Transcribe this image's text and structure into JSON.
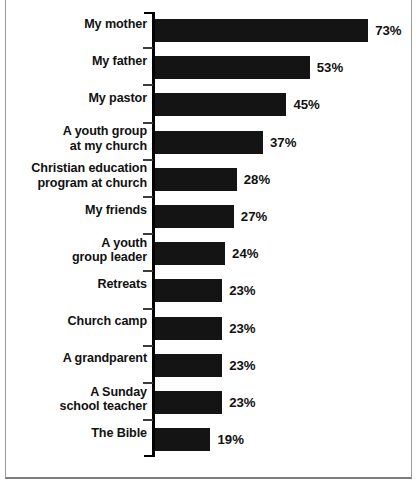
{
  "chart_data": {
    "type": "bar",
    "orientation": "horizontal",
    "title": "",
    "subtitle": "",
    "xlabel": "",
    "ylabel": "",
    "xlim": [
      0,
      80
    ],
    "grid": false,
    "legend": null,
    "value_suffix": "%",
    "categories": [
      "My mother",
      "My father",
      "My pastor",
      "A youth group at my church",
      "Christian education program at church",
      "My friends",
      "A youth group leader",
      "Retreats",
      "Church camp",
      "A grandparent",
      "A Sunday school teacher",
      "The Bible"
    ],
    "values": [
      73,
      53,
      45,
      37,
      28,
      27,
      24,
      23,
      23,
      23,
      23,
      19
    ],
    "data_labels": [
      "73%",
      "53%",
      "45%",
      "37%",
      "28%",
      "27%",
      "24%",
      "23%",
      "23%",
      "23%",
      "23%",
      "19%"
    ],
    "bars": [
      {
        "label_line1": "My mother",
        "label_line2": "",
        "value": 73,
        "data_label": "73%"
      },
      {
        "label_line1": "My father",
        "label_line2": "",
        "value": 53,
        "data_label": "53%"
      },
      {
        "label_line1": "My pastor",
        "label_line2": "",
        "value": 45,
        "data_label": "45%"
      },
      {
        "label_line1": "A youth group",
        "label_line2": "at my church",
        "value": 37,
        "data_label": "37%"
      },
      {
        "label_line1": "Christian education",
        "label_line2": "program at church",
        "value": 28,
        "data_label": "28%"
      },
      {
        "label_line1": "My friends",
        "label_line2": "",
        "value": 27,
        "data_label": "27%"
      },
      {
        "label_line1": "A youth",
        "label_line2": "group leader",
        "value": 24,
        "data_label": "24%"
      },
      {
        "label_line1": "Retreats",
        "label_line2": "",
        "value": 23,
        "data_label": "23%"
      },
      {
        "label_line1": "Church camp",
        "label_line2": "",
        "value": 23,
        "data_label": "23%"
      },
      {
        "label_line1": "A grandparent",
        "label_line2": "",
        "value": 23,
        "data_label": "23%"
      },
      {
        "label_line1": "A Sunday",
        "label_line2": "school teacher",
        "value": 23,
        "data_label": "23%"
      },
      {
        "label_line1": "The Bible",
        "label_line2": "",
        "value": 19,
        "data_label": "19%"
      }
    ],
    "colors": {
      "bar": "#141414",
      "axis": "#000000",
      "text": "#111111",
      "background": "#ffffff",
      "frame": "#9a9a9a"
    }
  }
}
